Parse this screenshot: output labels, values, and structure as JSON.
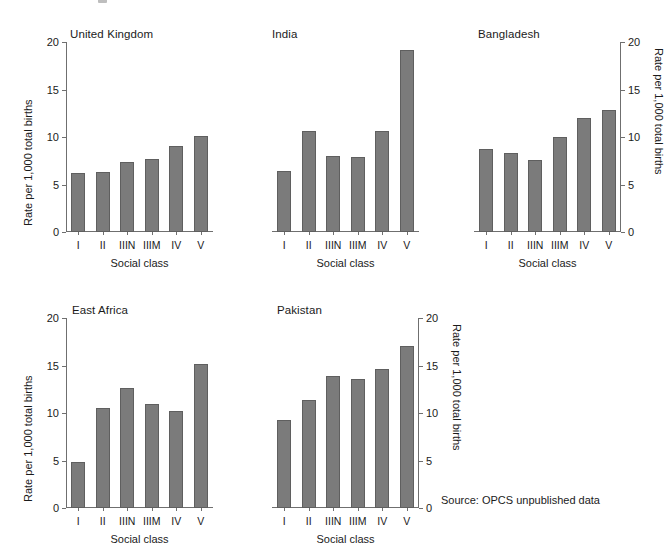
{
  "figure": {
    "source_note": "Source:  OPCS unpublished data",
    "bar_color": "#7b7b7b",
    "axis_color": "#6f6f6f",
    "text_color": "#1b1b1b"
  },
  "chart_data": {
    "type": "bar",
    "title": "",
    "categories": [
      "I",
      "II",
      "IIIN",
      "IIIM",
      "IV",
      "V"
    ],
    "xlabel": "Social class",
    "ylabel": "Rate per 1,000 total births",
    "ylim": [
      0,
      20
    ],
    "yticks": [
      0,
      5,
      10,
      15,
      20
    ],
    "grid": false,
    "legend": "none",
    "panels": [
      {
        "name": "United Kingdom",
        "axis_side": "left",
        "values": [
          6.2,
          6.3,
          7.4,
          7.65,
          9.05,
          10.1
        ]
      },
      {
        "name": "India",
        "axis_side": "none",
        "values": [
          6.4,
          10.65,
          8.0,
          7.9,
          10.6,
          19.2
        ]
      },
      {
        "name": "Bangladesh",
        "axis_side": "right",
        "values": [
          8.7,
          8.3,
          7.6,
          10.0,
          12.0,
          12.8
        ]
      },
      {
        "name": "East Africa",
        "axis_side": "left",
        "values": [
          4.8,
          10.5,
          12.6,
          11.0,
          10.2,
          15.2
        ]
      },
      {
        "name": "Pakistan",
        "axis_side": "right",
        "values": [
          9.3,
          11.4,
          13.9,
          13.6,
          14.6,
          17.1
        ]
      }
    ]
  }
}
